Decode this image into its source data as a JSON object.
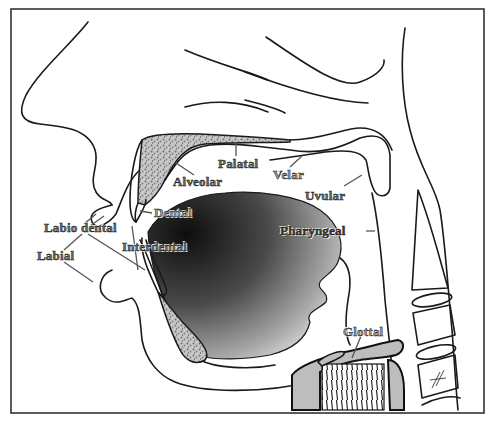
{
  "diagram": {
    "labels": {
      "palatal": "Palatal",
      "alveolar": "Alveolar",
      "velar": "Velar",
      "uvular": "Uvular",
      "dental": "Dental",
      "labiodental": "Labio dental",
      "interdental": "Interdental",
      "labial": "Labial",
      "pharyngeal": "Pharyngeal",
      "glottal": "Glottal"
    },
    "colors": {
      "frame": "#333333",
      "outline": "#1a1a1a",
      "tongue_dark": "#111111",
      "tongue_light": "#e6e6e6",
      "bone_texture": "#9a9a9a",
      "larynx_fill": "#bdbdbd"
    }
  }
}
